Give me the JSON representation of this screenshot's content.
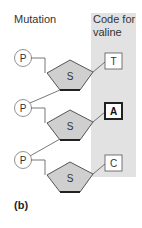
{
  "labels": {
    "mutation": "Mutation",
    "code_for": "Code for valine",
    "panel": "(b)"
  },
  "nucleotides": [
    {
      "phosphate": "P",
      "sugar": "S",
      "base": "T",
      "highlighted": false
    },
    {
      "phosphate": "P",
      "sugar": "S",
      "base": "A",
      "highlighted": true
    },
    {
      "phosphate": "P",
      "sugar": "S",
      "base": "C",
      "highlighted": false
    }
  ],
  "colors": {
    "band": "#e2e2e2",
    "sugar_fill": "#cfcfcf",
    "stroke": "#444444"
  }
}
